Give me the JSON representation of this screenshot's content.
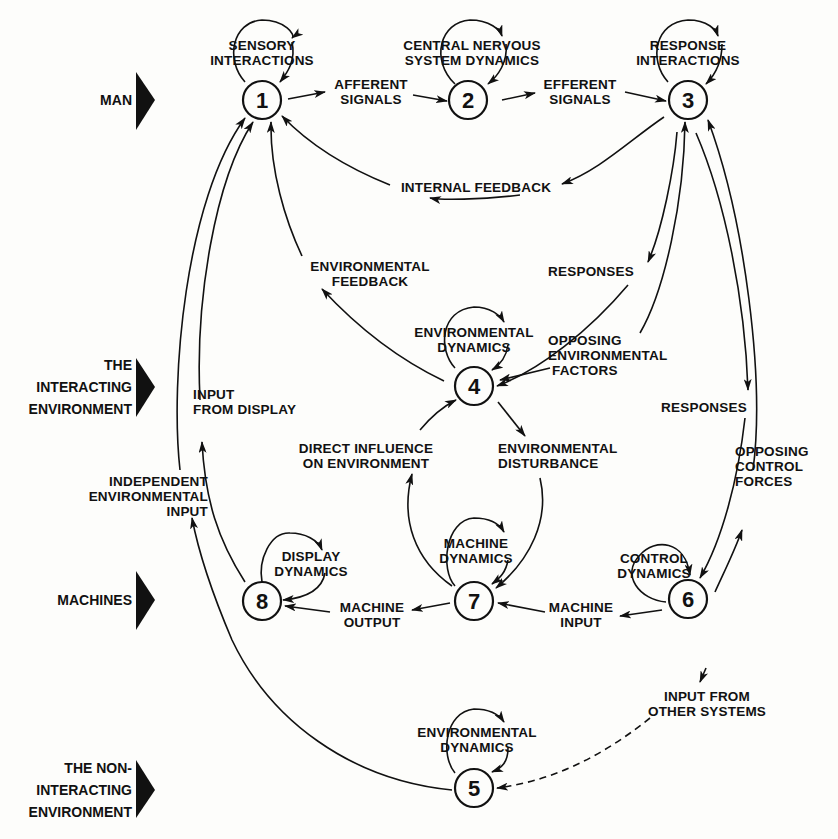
{
  "diagram": {
    "type": "flow-diagram",
    "title": "",
    "colors": {
      "ink": "#111111",
      "paper": "#fdfdfb"
    },
    "row_labels": [
      {
        "id": "man",
        "label": "MAN",
        "x": 132,
        "y": 100
      },
      {
        "id": "interacting-env",
        "label": "THE\nINTERACTING\nENVIRONMENT",
        "x": 132,
        "y": 387
      },
      {
        "id": "machines",
        "label": "MACHINES",
        "x": 132,
        "y": 600
      },
      {
        "id": "non-interacting-env",
        "label": "THE NON-\nINTERACTING\nENVIRONMENT",
        "x": 132,
        "y": 789
      }
    ],
    "nodes": [
      {
        "id": "1",
        "label": "1",
        "x": 262,
        "y": 100,
        "self_loop": "SENSORY\nINTERACTIONS"
      },
      {
        "id": "2",
        "label": "2",
        "x": 468,
        "y": 100,
        "self_loop": "CENTRAL NERVOUS\nSYSTEM DYNAMICS"
      },
      {
        "id": "3",
        "label": "3",
        "x": 688,
        "y": 100,
        "self_loop": "RESPONSE\nINTERACTIONS"
      },
      {
        "id": "4",
        "label": "4",
        "x": 474,
        "y": 386,
        "self_loop": "ENVIRONMENTAL\nDYNAMICS"
      },
      {
        "id": "5",
        "label": "5",
        "x": 474,
        "y": 788,
        "self_loop": "ENVIRONMENTAL\nDYNAMICS"
      },
      {
        "id": "6",
        "label": "6",
        "x": 688,
        "y": 599,
        "self_loop": "CONTROL\nDYNAMICS"
      },
      {
        "id": "7",
        "label": "7",
        "x": 474,
        "y": 601,
        "self_loop": "MACHINE\nDYNAMICS"
      },
      {
        "id": "8",
        "label": "8",
        "x": 262,
        "y": 601,
        "self_loop": "DISPLAY\nDYNAMICS"
      }
    ],
    "edges": [
      {
        "from": "1",
        "to": "2",
        "label": "AFFERENT\nSIGNALS"
      },
      {
        "from": "2",
        "to": "3",
        "label": "EFFERENT\nSIGNALS"
      },
      {
        "from": "3",
        "to": "1",
        "label": "INTERNAL FEEDBACK"
      },
      {
        "from": "4",
        "to": "1",
        "label": "ENVIRONMENTAL\nFEEDBACK"
      },
      {
        "from": "3",
        "to": "4",
        "label": "RESPONSES"
      },
      {
        "from": "4",
        "to": "3",
        "label": "OPPOSING\nENVIRONMENTAL\nFACTORS"
      },
      {
        "from": "3",
        "to": "6",
        "label": "RESPONSES"
      },
      {
        "from": "6",
        "to": "3",
        "label": "OPPOSING\nCONTROL\nFORCES"
      },
      {
        "from": "7",
        "to": "4",
        "label": "DIRECT INFLUENCE\nON ENVIRONMENT"
      },
      {
        "from": "4",
        "to": "7",
        "label": "ENVIRONMENTAL\nDISTURBANCE"
      },
      {
        "from": "6",
        "to": "7",
        "label": "MACHINE\nINPUT"
      },
      {
        "from": "7",
        "to": "8",
        "label": "MACHINE\nOUTPUT"
      },
      {
        "from": "8",
        "to": "1",
        "label": "INPUT\nFROM DISPLAY"
      },
      {
        "from": "5",
        "to": "1",
        "label": "INDEPENDENT\nENVIRONMENTAL\nINPUT"
      },
      {
        "from": "external",
        "to": "5",
        "label": "INPUT FROM\nOTHER SYSTEMS",
        "style": "dashed"
      }
    ]
  },
  "labels": {
    "n1_loop": "SENSORY\nINTERACTIONS",
    "n2_loop": "CENTRAL NERVOUS\nSYSTEM DYNAMICS",
    "n3_loop": "RESPONSE\nINTERACTIONS",
    "n4_loop": "ENVIRONMENTAL\nDYNAMICS",
    "n5_loop": "ENVIRONMENTAL\nDYNAMICS",
    "n6_loop": "CONTROL\nDYNAMICS",
    "n7_loop": "MACHINE\nDYNAMICS",
    "n8_loop": "DISPLAY\nDYNAMICS",
    "afferent": "AFFERENT\nSIGNALS",
    "efferent": "EFFERENT\nSIGNALS",
    "internal_feedback": "INTERNAL FEEDBACK",
    "env_feedback": "ENVIRONMENTAL\nFEEDBACK",
    "responses_upper": "RESPONSES",
    "opposing_env": "OPPOSING\nENVIRONMENTAL\n FACTORS",
    "responses_right": "RESPONSES",
    "opposing_control": "OPPOSING\nCONTROL\nFORCES",
    "direct_influence": "DIRECT INFLUENCE\nON ENVIRONMENT",
    "env_disturbance": "ENVIRONMENTAL\nDISTURBANCE",
    "machine_input": "MACHINE\nINPUT",
    "machine_output": "MACHINE\nOUTPUT",
    "input_from_display": "INPUT\nFROM DISPLAY",
    "independent_input": "INDEPENDENT\nENVIRONMENTAL\nINPUT",
    "input_other": "INPUT FROM\nOTHER SYSTEMS",
    "side_man": "MAN",
    "side_interacting": "THE\nINTERACTING\nENVIRONMENT",
    "side_machines": "MACHINES",
    "side_noninteracting": "THE NON-\nINTERACTING\nENVIRONMENT",
    "num_1": "1",
    "num_2": "2",
    "num_3": "3",
    "num_4": "4",
    "num_5": "5",
    "num_6": "6",
    "num_7": "7",
    "num_8": "8"
  }
}
